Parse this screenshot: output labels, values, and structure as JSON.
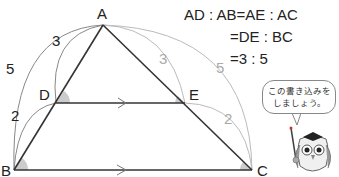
{
  "diagram": {
    "points": {
      "A": {
        "label": "A",
        "x": 103,
        "y": 25
      },
      "B": {
        "label": "B",
        "x": 14,
        "y": 170
      },
      "C": {
        "label": "C",
        "x": 252,
        "y": 170
      },
      "D": {
        "label": "D",
        "x": 56,
        "y": 103
      },
      "E": {
        "label": "E",
        "x": 185,
        "y": 103
      }
    },
    "segment_labels": {
      "AD": "3",
      "DB": "2",
      "AB": "5",
      "AE": "3",
      "EC": "2",
      "AC": "5"
    },
    "parallel_note": "DE ∥ BC (arrow marks)",
    "colors": {
      "lines": "#333333",
      "arcs_left": "#888888",
      "arcs_right": "#bbbbbb",
      "angle_fill": "#cccccc"
    }
  },
  "equations": {
    "line1": "AD : AB=AE : AC",
    "line2": "=DE : BC",
    "line3": "=3 : 5"
  },
  "mascot": {
    "speech_line1": "この書き込みを",
    "speech_line2": "しましょう。"
  }
}
